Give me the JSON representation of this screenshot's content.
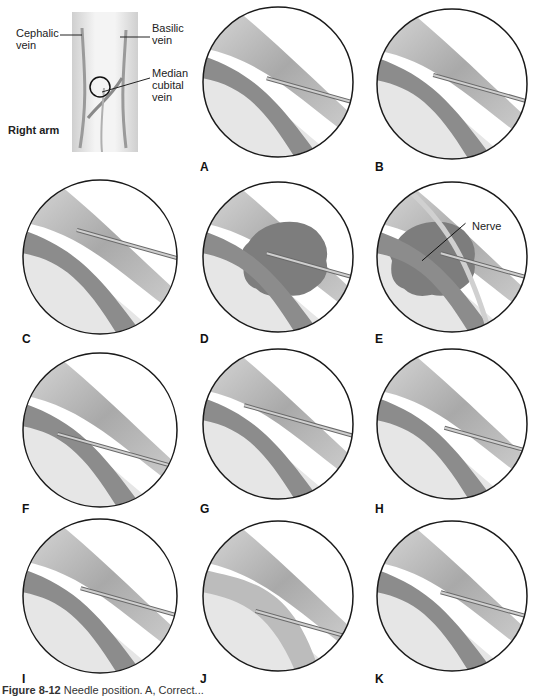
{
  "figure": {
    "arm_inset": {
      "labels": {
        "cephalic": [
          "Cephalic",
          "vein"
        ],
        "basilic": [
          "Basilic",
          "vein"
        ],
        "median": [
          "Median",
          "cubital",
          "vein"
        ],
        "side": "Right arm"
      }
    },
    "panels": [
      {
        "id": "A",
        "variant": "correct"
      },
      {
        "id": "B",
        "variant": "bevel-on-wall"
      },
      {
        "id": "C",
        "variant": "not-in-vein"
      },
      {
        "id": "D",
        "variant": "hematoma"
      },
      {
        "id": "E",
        "variant": "nerve",
        "annotation": "Nerve"
      },
      {
        "id": "F",
        "variant": "through-vein"
      },
      {
        "id": "G",
        "variant": "upper-wall"
      },
      {
        "id": "H",
        "variant": "lower-wall"
      },
      {
        "id": "I",
        "variant": "valve"
      },
      {
        "id": "J",
        "variant": "collapsed-missed"
      },
      {
        "id": "K",
        "variant": "collapsed"
      }
    ],
    "caption": {
      "prefix": "Figure 8-12",
      "text": " Needle position. A, Correct..."
    }
  },
  "colors": {
    "skin": "#e6e6e6",
    "tissue": "#bdbdbd",
    "vein": "#8c8c8c",
    "hematoma": "#7d7d7d",
    "needle": "#cfcfcf",
    "outline": "#1a1a1a"
  }
}
